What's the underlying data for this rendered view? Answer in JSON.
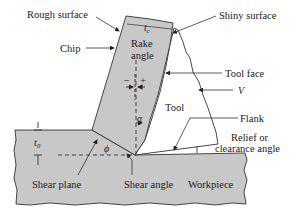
{
  "diagram": {
    "labels": {
      "rough_surface": "Rough surface",
      "chip": "Chip",
      "rake_angle_line1": "Rake",
      "rake_angle_line2": "angle",
      "chip_thickness": "t",
      "chip_thickness_sub": "c",
      "shiny_surface": "Shiny surface",
      "tool_face": "Tool face",
      "velocity": "V",
      "tool": "Tool",
      "flank": "Flank",
      "relief_line1": "Relief or",
      "relief_line2": "clearance angle",
      "depth_of_cut": "t",
      "depth_of_cut_sub": "0",
      "alpha": "α",
      "phi": "ϕ",
      "minus": "−",
      "plus": "+",
      "shear_plane": "Shear plane",
      "shear_angle": "Shear angle",
      "workpiece": "Workpiece"
    },
    "colors": {
      "material_fill": "#c8c8c8",
      "outline": "#333333",
      "text": "#222222",
      "background": "#ffffff"
    }
  }
}
